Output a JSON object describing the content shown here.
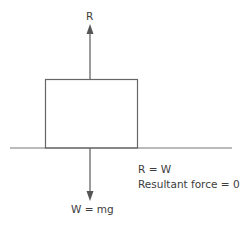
{
  "diagram": {
    "type": "free-body-diagram",
    "labels": {
      "reaction_force": "R",
      "weight": "W = mg",
      "equation_1": "R = W",
      "equation_2": "Resultant force = 0"
    },
    "colors": {
      "line": "#666666",
      "text": "#3c3c3c"
    }
  }
}
